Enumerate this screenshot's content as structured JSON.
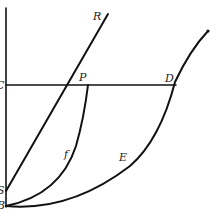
{
  "diagram": {
    "type": "geometric-figure",
    "labels": {
      "R": "R",
      "P": "P",
      "D": "D",
      "C": "C",
      "S": "S",
      "B": "B",
      "E": "E",
      "f": "f"
    },
    "colors": {
      "stroke": "#111111",
      "background": "#ffffff"
    },
    "points": {
      "B": [
        6,
        206
      ],
      "S": [
        6,
        190
      ],
      "C": [
        6,
        85
      ],
      "P": [
        87,
        85
      ],
      "D": [
        172,
        85
      ],
      "R": [
        108,
        14
      ]
    },
    "elements": [
      "vertical axis through C, S, B",
      "horizontal line C to D through P",
      "straight line S to R through P",
      "curve B-f-P (inner curve)",
      "curve B-E-D (outer parabola)"
    ]
  }
}
